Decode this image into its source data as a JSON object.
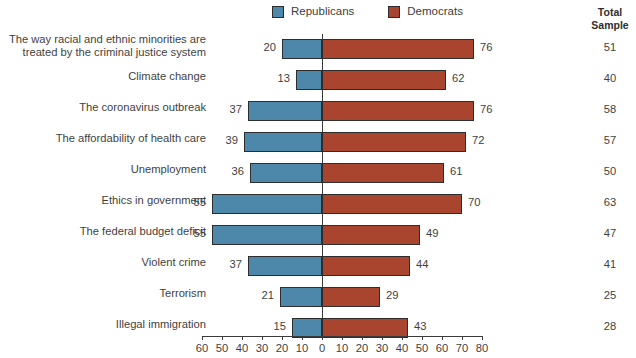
{
  "legend": {
    "items": [
      {
        "label": "Republicans",
        "color": "#4d87aa",
        "key": "republicans"
      },
      {
        "label": "Democrats",
        "color": "#a9452f",
        "key": "democrats"
      }
    ]
  },
  "total_header": {
    "line1": "Total",
    "line2": "Sample"
  },
  "chart_data": {
    "type": "bar",
    "orientation": "horizontal",
    "style": "diverging-bidirectional",
    "title": "",
    "subtitle": "",
    "xlabel": "",
    "ylabel": "",
    "grid": false,
    "legend_position": "top-center",
    "axis": {
      "left_max": 60,
      "right_max": 80,
      "center": 0,
      "left_ticks": [
        60,
        50,
        40,
        30,
        20,
        10,
        0
      ],
      "right_ticks": [
        10,
        20,
        30,
        40,
        50,
        60,
        70,
        80
      ],
      "tick_labels": [
        "60",
        "50",
        "40",
        "30",
        "20",
        "10",
        "0",
        "10",
        "20",
        "30",
        "40",
        "50",
        "60",
        "70",
        "80"
      ]
    },
    "categories": [
      "The way racial and ethnic minorities are treated by the criminal justice system",
      "Climate change",
      "The coronavirus outbreak",
      "The affordability of health care",
      "Unemployment",
      "Ethics in government",
      "The federal budget deficit",
      "Violent crime",
      "Terrorism",
      "Illegal immigration"
    ],
    "series": [
      {
        "name": "Republicans",
        "color": "#4d87aa",
        "values": [
          20,
          13,
          37,
          39,
          36,
          55,
          55,
          37,
          21,
          15
        ]
      },
      {
        "name": "Democrats",
        "color": "#a9452f",
        "values": [
          76,
          62,
          76,
          72,
          61,
          70,
          49,
          44,
          29,
          43
        ]
      }
    ],
    "total_sample": [
      51,
      40,
      58,
      57,
      50,
      63,
      47,
      41,
      25,
      28
    ]
  },
  "rows": [
    {
      "label_line1": "The way racial and ethnic minorities are",
      "label_line2": "treated by the criminal justice system",
      "republicans": 20,
      "democrats": 76,
      "total": 51
    },
    {
      "label_line1": "Climate change",
      "label_line2": "",
      "republicans": 13,
      "democrats": 62,
      "total": 40
    },
    {
      "label_line1": "The coronavirus outbreak",
      "label_line2": "",
      "republicans": 37,
      "democrats": 76,
      "total": 58
    },
    {
      "label_line1": "The affordability of health care",
      "label_line2": "",
      "republicans": 39,
      "democrats": 72,
      "total": 57
    },
    {
      "label_line1": "Unemployment",
      "label_line2": "",
      "republicans": 36,
      "democrats": 61,
      "total": 50
    },
    {
      "label_line1": "Ethics in government",
      "label_line2": "",
      "republicans": 55,
      "democrats": 70,
      "total": 63
    },
    {
      "label_line1": "The federal budget deficit",
      "label_line2": "",
      "republicans": 55,
      "democrats": 49,
      "total": 47
    },
    {
      "label_line1": "Violent crime",
      "label_line2": "",
      "republicans": 37,
      "democrats": 44,
      "total": 41
    },
    {
      "label_line1": "Terrorism",
      "label_line2": "",
      "republicans": 21,
      "democrats": 29,
      "total": 25
    },
    {
      "label_line1": "Illegal immigration",
      "label_line2": "",
      "republicans": 15,
      "democrats": 43,
      "total": 28
    }
  ]
}
